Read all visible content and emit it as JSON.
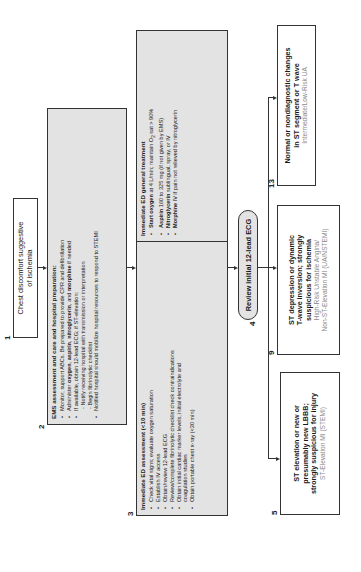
{
  "diagram": {
    "orientation": "rotated-90-ccw",
    "colors": {
      "border": "#333333",
      "shaded_fill": "#e3e3e3",
      "subtext": "#8a8a8a"
    },
    "step1": {
      "number": "1",
      "text_line1": "Chest discomfort suggestive",
      "text_line2": "of ischemia"
    },
    "step2": {
      "number": "2",
      "title": "EMS assessment and care and hospital preparation:",
      "items": [
        {
          "type": "bullet",
          "text": "Monitor, support ABCs. Be prepared to provide CPR and defibrillation"
        },
        {
          "type": "bullet",
          "pre": "Administer ",
          "b1": "oxygen",
          "m1": ", ",
          "b2": "aspirin",
          "m2": ", ",
          "b3": "nitroglycerin",
          "m3": ", and ",
          "b4": "morphine",
          "post": " if needed"
        },
        {
          "type": "bullet",
          "text": "If available, obtain 12-lead ECG; if ST-elevation:"
        },
        {
          "type": "indent",
          "text": "- Notify receiving hospital with transmission or interpretation"
        },
        {
          "type": "indent",
          "text": "- Begin fibrinolytic checklist"
        },
        {
          "type": "bullet",
          "text": "Notified hospital should mobilize hospital resources to respond to STEMI"
        }
      ]
    },
    "step3": {
      "number": "3",
      "assessment": {
        "title": "Immediate ED assessment (<10 min)",
        "items": [
          "Check vital signs; evaluate oxygen saturation",
          "Establish IV access",
          "Obtain/review 12-lead ECG",
          "Review/complete fibrinolytic checklist check contraindications",
          "Obtain initial cardiac marker levels, initial electrolyte and",
          "coagulation studies",
          "Obtain portable chest x-ray (<30 min)"
        ]
      },
      "treatment": {
        "title": "Immediate ED general treatment",
        "items": [
          {
            "bold": "Start oxygen",
            "rest_pre": " at 4 L/min; maintain O",
            "sub": "2",
            "rest_post": " sat > 90%"
          },
          {
            "bold": "Aspirin",
            "rest_pre": " 160 to 325 mg (if not given by EMS)",
            "sub": "",
            "rest_post": ""
          },
          {
            "bold": "Nitroglycerin",
            "rest_pre": " sublingual, spray, or IV",
            "sub": "",
            "rest_post": ""
          },
          {
            "bold": "Morphine",
            "rest_pre": " IV if pain not relieved by nitroglycerin",
            "sub": "",
            "rest_post": ""
          }
        ]
      }
    },
    "step4": {
      "number": "4",
      "text": "Review initial 12-lead ECG"
    },
    "step5": {
      "number": "5",
      "line1": "ST elevation or new or",
      "line2": "presumably new LBBB;",
      "line3": "strongly suspicious for injury",
      "sub": "ST-Elevation MI (STEMI)"
    },
    "step9": {
      "number": "9",
      "line1": "ST depression or dynamic",
      "line2": "T-wave inversion; strongly",
      "line3": "suspicious for ischemia",
      "sub1": "High-Risk Unstable Angina/",
      "sub2": "Non-ST-Elevation MI (UA/NSTEMI)"
    },
    "step13": {
      "number": "13",
      "line1": "Normal or nondiagnostic changes",
      "line2": "in ST segment or T wave",
      "sub": "Intermediate/Low-Risk UA"
    }
  }
}
